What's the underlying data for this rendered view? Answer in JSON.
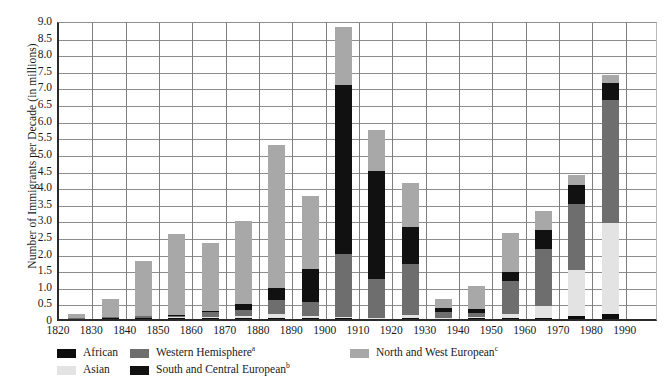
{
  "chart_data": {
    "type": "bar",
    "stacked": true,
    "title": "",
    "xlabel": "",
    "ylabel": "Number of Immigrants per Decade (in millions)",
    "ylim": [
      0,
      9.0
    ],
    "ytick_step": 0.5,
    "ytick_labels": [
      "9.0",
      "8.5",
      "8.0",
      "7.5",
      "7.0",
      "6.5",
      "6.0",
      "5.5",
      "5.0",
      "4.5",
      "4.0",
      "3.5",
      "3.0",
      "2.5",
      "2.0",
      "1.5",
      "1.0",
      "0.5",
      "0"
    ],
    "grid": true,
    "legend_position": "bottom",
    "categories": [
      "1820",
      "1830",
      "1840",
      "1850",
      "1860",
      "1870",
      "1880",
      "1890",
      "1900",
      "1910",
      "1920",
      "1930",
      "1940",
      "1950",
      "1960",
      "1970",
      "1980",
      "1990"
    ],
    "series": [
      {
        "name": "African",
        "label": "African",
        "footnote": "",
        "color": "#0d0d0d",
        "values": [
          0.02,
          0.02,
          0.02,
          0.02,
          0.02,
          0.02,
          0.02,
          0.02,
          0.02,
          0.02,
          0.02,
          0.02,
          0.02,
          0.03,
          0.04,
          0.08,
          0.14,
          0.0
        ]
      },
      {
        "name": "Asian",
        "label": "Asian",
        "footnote": "",
        "color": "#e3e3e3",
        "values": [
          0.0,
          0.0,
          0.0,
          0.03,
          0.05,
          0.07,
          0.12,
          0.07,
          0.03,
          0.02,
          0.11,
          0.02,
          0.04,
          0.12,
          0.36,
          1.4,
          2.76,
          0.0
        ]
      },
      {
        "name": "Western Hemisphere",
        "label": "Western Hemisphere",
        "footnote": "a",
        "color": "#6e6e6e",
        "values": [
          0.01,
          0.05,
          0.08,
          0.06,
          0.13,
          0.17,
          0.42,
          0.43,
          1.9,
          1.17,
          1.52,
          0.16,
          0.13,
          1.0,
          1.72,
          1.98,
          3.7,
          0.0
        ]
      },
      {
        "name": "South and Central European",
        "label": "South and Central European",
        "footnote": "b",
        "color": "#111111",
        "values": [
          0.0,
          0.0,
          0.0,
          0.02,
          0.05,
          0.2,
          0.37,
          0.98,
          5.1,
          3.25,
          1.12,
          0.14,
          0.1,
          0.28,
          0.55,
          0.58,
          0.5,
          0.0
        ]
      },
      {
        "name": "North and West European",
        "label": "North and West European",
        "footnote": "c",
        "color": "#a8a8a8",
        "values": [
          0.12,
          0.53,
          1.65,
          2.42,
          2.05,
          2.49,
          4.32,
          2.2,
          1.75,
          1.24,
          1.33,
          0.26,
          0.71,
          1.17,
          0.58,
          0.31,
          0.25,
          0.0
        ]
      }
    ],
    "totals": [
      0.15,
      0.6,
      1.75,
      2.55,
      2.3,
      2.95,
      5.25,
      3.7,
      8.8,
      5.7,
      4.1,
      0.6,
      1.0,
      2.6,
      3.25,
      4.35,
      7.35,
      0.0
    ]
  },
  "legend": {
    "column1": [
      {
        "label": "African",
        "footnote": "",
        "color": "#0d0d0d"
      },
      {
        "label": "Asian",
        "footnote": "",
        "color": "#e3e3e3"
      }
    ],
    "column2": [
      {
        "label": "Western Hemisphere",
        "footnote": "a",
        "color": "#6e6e6e"
      },
      {
        "label": "South and Central European",
        "footnote": "b",
        "color": "#111111"
      }
    ],
    "column3": [
      {
        "label": "North and West European",
        "footnote": "c",
        "color": "#a8a8a8"
      }
    ]
  }
}
